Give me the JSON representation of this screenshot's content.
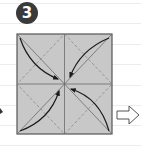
{
  "diagram": {
    "type": "origami-instruction-step",
    "step_number": "3",
    "paper_color": "#c8c8c8",
    "outline_color": "#555555",
    "arrow_color": "#1a1a1a",
    "fold_lines": {
      "valley_solid": [
        "vertical-center",
        "horizontal-center"
      ],
      "dashed_diamond": true,
      "solid_diagonals": true
    },
    "arrows": [
      {
        "from": "top-left-corner",
        "to": "center"
      },
      {
        "from": "top-right-corner",
        "to": "center"
      },
      {
        "from": "bottom-left-corner",
        "to": "center"
      },
      {
        "from": "bottom-right-corner",
        "to": "center"
      }
    ],
    "next_step_arrow": "outline-right-arrow"
  }
}
